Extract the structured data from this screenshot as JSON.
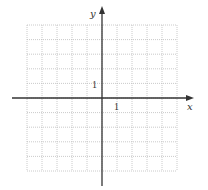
{
  "diagram": {
    "type": "cartesian-coordinate-plane",
    "grid": {
      "columns": 10,
      "rows": 10,
      "x_range": [
        -5,
        5
      ],
      "y_range": [
        -5,
        5
      ],
      "style": "dotted",
      "color": "#bdbdbd"
    },
    "axes": {
      "color": "#333333",
      "x_label": "x",
      "y_label": "y",
      "x_tick_label": "1",
      "y_tick_label": "1"
    }
  }
}
